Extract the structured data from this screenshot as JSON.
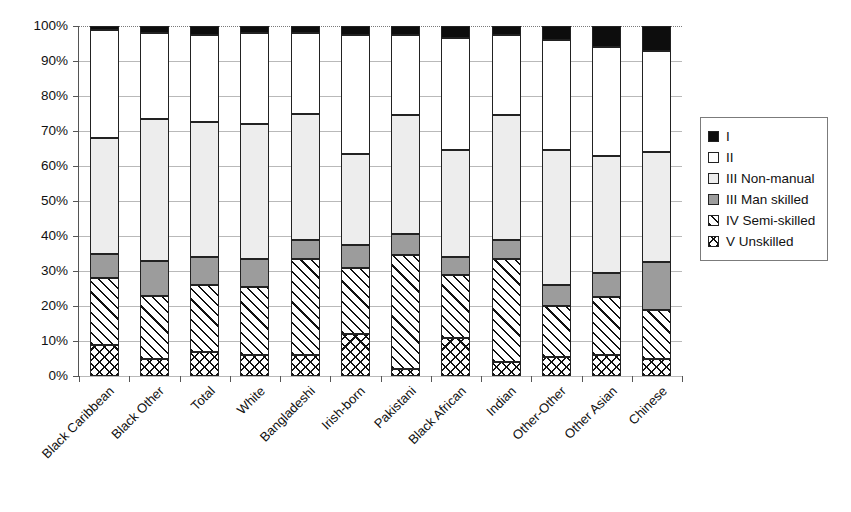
{
  "chart_data": {
    "type": "bar",
    "stacked": true,
    "normalized_percent": true,
    "title": "",
    "xlabel": "",
    "ylabel": "",
    "ylim": [
      0,
      100
    ],
    "grid": true,
    "legend_position": "right",
    "y_ticks": [
      "0%",
      "10%",
      "20%",
      "30%",
      "40%",
      "50%",
      "60%",
      "70%",
      "80%",
      "90%",
      "100%"
    ],
    "y_tick_values": [
      0,
      10,
      20,
      30,
      40,
      50,
      60,
      70,
      80,
      90,
      100
    ],
    "categories": [
      "Black Caribbean",
      "Black Other",
      "Total",
      "White",
      "Bangladeshi",
      "Irish-born",
      "Pakistani",
      "Black African",
      "Indian",
      "Other-Other",
      "Other Asian",
      "Chinese"
    ],
    "series": [
      {
        "name": "V Unskilled",
        "fill": "cross-hatch",
        "values": [
          9,
          5,
          7,
          6,
          6,
          12,
          2,
          11,
          4,
          5.5,
          6,
          5
        ]
      },
      {
        "name": "IV Semi-skilled",
        "fill": "diagonal-hatch",
        "values": [
          19,
          18,
          19,
          19.5,
          27.5,
          19,
          32.5,
          18,
          29.5,
          14.5,
          16.5,
          14
        ]
      },
      {
        "name": "III Man skilled",
        "fill": "gray",
        "values": [
          7,
          10,
          8,
          8,
          5.5,
          6.5,
          6,
          5,
          5.5,
          6,
          7,
          13.5
        ]
      },
      {
        "name": "III Non-manual",
        "fill": "light-gray",
        "values": [
          33,
          40.5,
          38.5,
          38.5,
          36,
          26,
          34,
          30.5,
          35.5,
          38.5,
          33.5,
          31.5
        ]
      },
      {
        "name": "II",
        "fill": "white",
        "values": [
          31,
          24.5,
          25,
          26,
          23,
          34,
          23,
          32,
          23,
          31.5,
          31,
          29
        ]
      },
      {
        "name": "I",
        "fill": "black",
        "values": [
          1,
          2,
          2.5,
          2,
          2,
          2.5,
          2.5,
          3.5,
          2.5,
          4,
          6,
          7
        ]
      }
    ]
  },
  "legend": {
    "items": [
      {
        "label": "I",
        "fill": "black"
      },
      {
        "label": "II",
        "fill": "white"
      },
      {
        "label": "III Non-manual",
        "fill": "light-gray"
      },
      {
        "label": "III Man skilled",
        "fill": "gray"
      },
      {
        "label": "IV Semi-skilled",
        "fill": "diagonal-hatch"
      },
      {
        "label": "V Unskilled",
        "fill": "cross-hatch"
      }
    ]
  },
  "colors": {
    "class_I": "#0d0d0d",
    "class_II": "#ffffff",
    "class_III_non_manual": "#ededed",
    "class_III_man_skilled": "#9c9c9c",
    "axis": "#555555",
    "gridline": "#b9b9b9"
  }
}
